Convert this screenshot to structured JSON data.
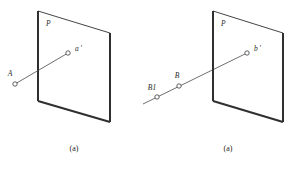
{
  "figure": {
    "background": "#ffffff",
    "stroke_color": "#2f2f2f",
    "line_color": "#4a4a4a",
    "panels": [
      {
        "id": "panel-a-left",
        "caption": "(a)",
        "plane_label": "P",
        "plane_vertices": "38,11 110,33 110,122 38,101",
        "plane_thick_edges": [
          {
            "name": "plane-left-edge",
            "d": "M 38 11 L 38 101",
            "width": 2.0
          },
          {
            "name": "plane-bottom-edge",
            "d": "M 38 101 L 110 122",
            "width": 2.0
          },
          {
            "name": "plane-right-edge",
            "d": "M 110 33 L 110 122",
            "width": 2.0
          }
        ],
        "plane_thin_edges": [
          {
            "name": "plane-top-edge",
            "d": "M 38 11 L 110 33",
            "width": 0.9
          }
        ],
        "ray": {
          "name": "ray-A-to-a-prime",
          "d": "M 15 84 L 68 53"
        },
        "points": [
          {
            "id": "A",
            "label": "A",
            "cx": 15,
            "cy": 84,
            "r": 2.2,
            "label_x": 10,
            "label_y": 76,
            "anchor": "middle"
          },
          {
            "id": "a-prime",
            "label": "a ′",
            "cx": 68,
            "cy": 53,
            "r": 2.2,
            "label_x": 75,
            "label_y": 51,
            "anchor": "start"
          }
        ],
        "plane_label_x": 46,
        "plane_label_y": 26,
        "caption_x": 74,
        "caption_y": 151
      },
      {
        "id": "panel-a-right",
        "caption": "(a)",
        "plane_label": "P",
        "plane_vertices": "213,11 283,33 283,122 213,101",
        "plane_thick_edges": [
          {
            "name": "plane-left-edge",
            "d": "M 213 11 L 213 101",
            "width": 2.0
          },
          {
            "name": "plane-bottom-edge",
            "d": "M 213 101 L 283 122",
            "width": 2.0
          },
          {
            "name": "plane-right-edge",
            "d": "M 283 33 L 283 122",
            "width": 2.0
          }
        ],
        "plane_thin_edges": [
          {
            "name": "plane-top-edge",
            "d": "M 213 11 L 283 33",
            "width": 0.9
          }
        ],
        "ray": {
          "name": "ray-B1-through-plane-to-b-prime",
          "d": "M 143 104 L 247 53"
        },
        "points": [
          {
            "id": "B1",
            "label": "B1",
            "cx": 157,
            "cy": 97,
            "r": 2.2,
            "label_x": 152,
            "label_y": 90,
            "anchor": "middle"
          },
          {
            "id": "B",
            "label": "B",
            "cx": 179,
            "cy": 86,
            "r": 2.2,
            "label_x": 177,
            "label_y": 78,
            "anchor": "middle"
          },
          {
            "id": "b-prime",
            "label": "b ′",
            "cx": 247,
            "cy": 53,
            "r": 2.2,
            "label_x": 254,
            "label_y": 51,
            "anchor": "start"
          }
        ],
        "plane_label_x": 221,
        "plane_label_y": 26,
        "caption_x": 228,
        "caption_y": 151
      }
    ]
  }
}
